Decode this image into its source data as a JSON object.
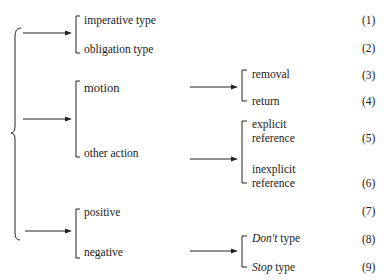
{
  "diagram": {
    "type": "classification-tree",
    "groups": [
      {
        "items": [
          {
            "label": "imperative type",
            "number": "(1)"
          },
          {
            "label": "obligation type",
            "number": "(2)"
          }
        ]
      },
      {
        "items": [
          {
            "label": "motion",
            "children": [
              {
                "label": "removal",
                "number": "(3)"
              },
              {
                "label": "return",
                "number": "(4)"
              }
            ]
          },
          {
            "label": "other action",
            "children": [
              {
                "label_line1": "explicit",
                "label_line2": "reference",
                "number": "(5)"
              },
              {
                "label_line1": "inexplicit",
                "label_line2": "reference",
                "number": "(6)"
              }
            ]
          }
        ]
      },
      {
        "items": [
          {
            "label": "positive",
            "number": "(7)"
          },
          {
            "label": "negative",
            "children": [
              {
                "label_italic": "Don't",
                "label_rest": "type",
                "number": "(8)"
              },
              {
                "label_italic": "Stop",
                "label_rest": "type",
                "number": "(9)"
              }
            ]
          }
        ]
      }
    ]
  },
  "colors": {
    "ink": "#1a1a1a",
    "background": "#ffffff"
  }
}
